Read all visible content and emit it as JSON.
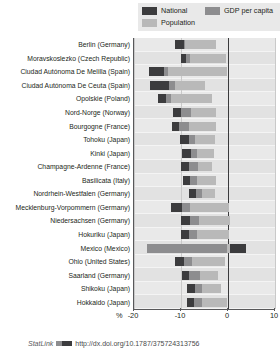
{
  "legend": {
    "items": [
      {
        "label": "National",
        "color": "#3c3c3e",
        "name": "legend-national"
      },
      {
        "label": "GDP per capita",
        "color": "#8d8d8f",
        "name": "legend-gdp-per-capita"
      },
      {
        "label": "Population",
        "color": "#b9b9b9",
        "name": "legend-population"
      }
    ]
  },
  "axis": {
    "unit": "%",
    "ticks": [
      "-20",
      "-10",
      "0",
      "10"
    ],
    "tick_values": [
      -20,
      -10,
      0,
      10
    ]
  },
  "footer": {
    "statlink_label": "StatLink",
    "url": "http://dx.doi.org/10.1787/375724313756"
  },
  "chart_data": {
    "type": "bar",
    "orientation": "horizontal",
    "title": "",
    "xlabel": "%",
    "ylabel": "",
    "xlim": [
      -20,
      10
    ],
    "grid": true,
    "legend_position": "top-right",
    "categories": [
      "Berlin (Germany)",
      "Moravskoslezko (Czech Republic)",
      "Ciudad Autónoma De Melilla  (Spain)",
      "Ciudad Autónoma De Ceuta (Spain)",
      "Opolskie (Poland)",
      "Nord-Norge (Norway)",
      "Bourgogne (France)",
      "Tohoku (Japan)",
      "Kinki (Japan)",
      "Champagne-Ardenne (France)",
      "Basilicata (Italy)",
      "Nordrhein-Westfalen (Germany)",
      "Mecklenburg-Vorpommern (Germany)",
      "Niedersachsen (Germany)",
      "Hokuriku (Japan)",
      "Mexico (Mexico)",
      "Ohio (United States)",
      "Saarland (Germany)",
      "Shikoku (Japan)",
      "Hokkaido (Japan)"
    ],
    "series": [
      {
        "name": "National",
        "color": "#3c3c3e",
        "values": [
          -10.9,
          -9.3,
          -16.2,
          -16.0,
          -14.4,
          -11.3,
          -11.6,
          -9.9,
          -9.3,
          -9.7,
          -9.2,
          -8.0,
          -11.8,
          -9.7,
          -9.5,
          -16.9,
          -10.9,
          -9.4,
          -8.3,
          -8.4
        ]
      },
      {
        "name": "GDP per capita",
        "color": "#8d8d8f",
        "values": [
          -9.2,
          -8.0,
          -12.8,
          -11.3,
          -12.2,
          -7.9,
          -8.2,
          -7.0,
          -6.5,
          -6.4,
          -6.5,
          -5.5,
          -8.0,
          -6.2,
          -6.5,
          -13.1,
          -7.7,
          -6.0,
          -5.6,
          -5.6
        ]
      },
      {
        "name": "Population",
        "color": "#b9b9b9",
        "values": [
          -2.6,
          -0.4,
          -0.3,
          -4.8,
          -3.5,
          -2.6,
          -2.5,
          -2.8,
          -3.0,
          -3.3,
          -2.6,
          -2.8,
          0.3,
          0.4,
          0.3,
          3.9,
          -0.6,
          -2.2,
          -1.4,
          -0.2
        ]
      }
    ],
    "bars": [
      {
        "category": "Berlin (Germany)",
        "pop_start": -11.3,
        "pop_end": -2.6,
        "gdp_start": -11.3,
        "gdp_end": -9.2,
        "nat_start": -11.3,
        "nat_end": -9.3
      },
      {
        "category": "Moravskoslezko (Czech Republic)",
        "pop_start": -10.0,
        "pop_end": -0.4,
        "gdp_start": -10.0,
        "gdp_end": -8.0,
        "nat_start": -10.0,
        "nat_end": -9.0
      },
      {
        "category": "Ciudad Autónoma De Melilla  (Spain)",
        "pop_start": -16.8,
        "pop_end": -0.3,
        "gdp_start": -16.8,
        "gdp_end": -12.8,
        "nat_start": -16.8,
        "nat_end": -13.6
      },
      {
        "category": "Ciudad Autónoma De Ceuta (Spain)",
        "pop_start": -16.6,
        "pop_end": -4.8,
        "gdp_start": -16.6,
        "gdp_end": -11.3,
        "nat_start": -16.6,
        "nat_end": -12.6
      },
      {
        "category": "Opolskie (Poland)",
        "pop_start": -15.0,
        "pop_end": -3.5,
        "gdp_start": -15.0,
        "gdp_end": -12.2,
        "nat_start": -15.0,
        "nat_end": -13.2
      },
      {
        "category": "Nord-Norge (Norway)",
        "pop_start": -11.7,
        "pop_end": -2.6,
        "gdp_start": -11.7,
        "gdp_end": -7.9,
        "nat_start": -11.7,
        "nat_end": -10.1
      },
      {
        "category": "Bourgogne (France)",
        "pop_start": -12.0,
        "pop_end": -2.5,
        "gdp_start": -12.0,
        "gdp_end": -8.2,
        "nat_start": -12.0,
        "nat_end": -10.4
      },
      {
        "category": "Tohoku (Japan)",
        "pop_start": -10.3,
        "pop_end": -2.8,
        "gdp_start": -10.3,
        "gdp_end": -7.0,
        "nat_start": -10.3,
        "nat_end": -8.3
      },
      {
        "category": "Kinki (Japan)",
        "pop_start": -9.7,
        "pop_end": -3.0,
        "gdp_start": -9.7,
        "gdp_end": -6.5,
        "nat_start": -9.7,
        "nat_end": -7.8
      },
      {
        "category": "Champagne-Ardenne (France)",
        "pop_start": -10.1,
        "pop_end": -3.3,
        "gdp_start": -10.1,
        "gdp_end": -6.4,
        "nat_start": -10.1,
        "nat_end": -8.4
      },
      {
        "category": "Basilicata (Italy)",
        "pop_start": -9.6,
        "pop_end": -2.6,
        "gdp_start": -9.6,
        "gdp_end": -6.5,
        "nat_start": -9.6,
        "nat_end": -8.0
      },
      {
        "category": "Nordrhein-Westfalen (Germany)",
        "pop_start": -8.4,
        "pop_end": -2.8,
        "gdp_start": -8.4,
        "gdp_end": -5.5,
        "nat_start": -8.4,
        "nat_end": -6.9
      },
      {
        "category": "Mecklenburg-Vorpommern (Germany)",
        "pop_start": -12.2,
        "pop_end": 0.3,
        "gdp_start": -12.2,
        "gdp_end": -8.0,
        "nat_start": -12.2,
        "nat_end": -9.7
      },
      {
        "category": "Niedersachsen (Germany)",
        "pop_start": -10.1,
        "pop_end": 0.4,
        "gdp_start": -10.1,
        "gdp_end": -6.2,
        "nat_start": -10.1,
        "nat_end": -8.0
      },
      {
        "category": "Hokuriku (Japan)",
        "pop_start": -9.9,
        "pop_end": 0.3,
        "gdp_start": -9.9,
        "gdp_end": -6.5,
        "nat_start": -9.9,
        "nat_end": -8.2
      },
      {
        "category": "Mexico (Mexico)",
        "pop_start": -17.3,
        "pop_end": 3.9,
        "gdp_start": -17.3,
        "gdp_end": -0.2,
        "nat_start": 0.4,
        "nat_end": 3.9
      },
      {
        "category": "Ohio (United States)",
        "pop_start": -11.3,
        "pop_end": -0.6,
        "gdp_start": -11.3,
        "gdp_end": -7.7,
        "nat_start": -11.3,
        "nat_end": -9.3
      },
      {
        "category": "Saarland (Germany)",
        "pop_start": -9.8,
        "pop_end": -2.2,
        "gdp_start": -9.8,
        "gdp_end": -6.0,
        "nat_start": -9.8,
        "nat_end": -8.2
      },
      {
        "category": "Shikoku (Japan)",
        "pop_start": -8.7,
        "pop_end": -1.4,
        "gdp_start": -8.7,
        "gdp_end": -5.6,
        "nat_start": -8.7,
        "nat_end": -7.1
      },
      {
        "category": "Hokkaido (Japan)",
        "pop_start": -8.8,
        "pop_end": -0.2,
        "gdp_start": -8.8,
        "gdp_end": -5.6,
        "nat_start": -8.8,
        "nat_end": -7.2
      }
    ]
  }
}
